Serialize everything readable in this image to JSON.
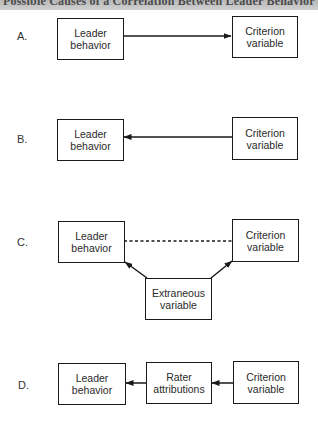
{
  "header": {
    "title": "Possible Causes of a Correlation Between Leader Behavior and a Criterion Variable"
  },
  "panels": [
    {
      "label": "A.",
      "description": "Leader behavior causes criterion variable",
      "boxes": {
        "leader": [
          "Leader",
          "behavior"
        ],
        "criterion": [
          "Criterion",
          "variable"
        ]
      },
      "relation": "leader -> criterion"
    },
    {
      "label": "B.",
      "description": "Criterion variable causes leader behavior",
      "boxes": {
        "leader": [
          "Leader",
          "behavior"
        ],
        "criterion": [
          "Criterion",
          "variable"
        ]
      },
      "relation": "criterion -> leader"
    },
    {
      "label": "C.",
      "description": "Extraneous variable causes both",
      "boxes": {
        "leader": [
          "Leader",
          "behavior"
        ],
        "criterion": [
          "Criterion",
          "variable"
        ],
        "extraneous": [
          "Extraneous",
          "variable"
        ]
      },
      "relation": "extraneous -> leader; extraneous -> criterion; leader - - criterion (spurious)"
    },
    {
      "label": "D.",
      "description": "Criterion variable influences rater attributions which affect leader behavior ratings",
      "boxes": {
        "leader": [
          "Leader",
          "behavior"
        ],
        "rater": [
          "Rater",
          "attributions"
        ],
        "criterion": [
          "Criterion",
          "variable"
        ]
      },
      "relation": "criterion -> rater -> leader"
    }
  ],
  "colors": {
    "line": "#1a1a1a",
    "header_bg": "#c4c4c4",
    "background": "#ffffff"
  }
}
